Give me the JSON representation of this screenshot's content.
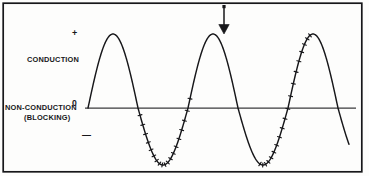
{
  "figure": {
    "background_color": "#fdfdfc",
    "ink_color": "#17171a",
    "border": {
      "name": "figure-border",
      "color": "#17171a",
      "width_px": 1.6
    }
  },
  "labels": {
    "plus": "+",
    "minus": "—",
    "zero": "0",
    "conduction": "CONDUCTION",
    "non_conduction": "NON-CONDUCTION",
    "blocking": "(BLOCKING)"
  },
  "annotations": {
    "arrow": {
      "icon": "arrow-down-icon",
      "points_to": "second-positive-peak",
      "x": 224,
      "y_start": 5,
      "y_end": 34
    }
  },
  "chart_data": {
    "type": "line",
    "xlabel": "",
    "ylabel": "",
    "grid": false,
    "legend": false,
    "axis": {
      "zero_line_y_px": 108,
      "zero_line_x_start_px": 85,
      "zero_line_x_end_px": 356,
      "tick_labels": [
        "+",
        "0",
        "—"
      ]
    },
    "waveform": {
      "shape": "sine",
      "start_x_px": 88,
      "period_px": 100,
      "positive_amplitude_px": 74,
      "negative_amplitude_px": 57,
      "cycles_shown": 2.6,
      "clipped_right": true
    },
    "features": [
      {
        "name": "positive-peak-1",
        "x_px": 115,
        "y_px": 34,
        "polarity": "positive"
      },
      {
        "name": "zero-crossing-1",
        "x_px": 150,
        "y_px": 108,
        "polarity": "zero"
      },
      {
        "name": "negative-trough-1",
        "x_px": 165,
        "y_px": 165,
        "polarity": "negative"
      },
      {
        "name": "zero-crossing-2",
        "x_px": 188,
        "y_px": 108,
        "polarity": "zero"
      },
      {
        "name": "positive-peak-2",
        "x_px": 224,
        "y_px": 34,
        "polarity": "positive"
      },
      {
        "name": "zero-crossing-3",
        "x_px": 260,
        "y_px": 108,
        "polarity": "zero"
      },
      {
        "name": "negative-trough-2",
        "x_px": 285,
        "y_px": 165,
        "polarity": "negative"
      },
      {
        "name": "zero-crossing-4",
        "x_px": 310,
        "y_px": 108,
        "polarity": "zero"
      },
      {
        "name": "positive-peak-3",
        "x_px": 348,
        "y_px": 36,
        "polarity": "positive"
      }
    ],
    "hatching": {
      "applies_to": "negative-half-cycles",
      "style": "perpendicular-tick-marks",
      "marks_per_lobe": 18,
      "mark_length_px": 4,
      "meaning": "NON-CONDUCTION (BLOCKING)"
    },
    "regions": [
      {
        "name": "conduction",
        "polarity": "positive",
        "label": "CONDUCTION"
      },
      {
        "name": "non-conduction",
        "polarity": "negative",
        "label": "NON-CONDUCTION (BLOCKING)"
      }
    ]
  }
}
